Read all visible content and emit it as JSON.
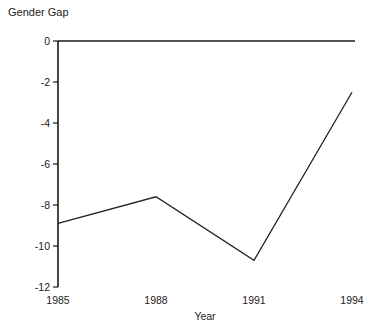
{
  "chart_data": {
    "type": "line",
    "title": "Gender Gap",
    "xlabel": "Year",
    "ylabel": "",
    "x": [
      1985,
      1988,
      1991,
      1994
    ],
    "values": [
      -8.9,
      -7.6,
      -10.7,
      -2.5
    ],
    "series": [
      {
        "name": "Gender Gap",
        "values": [
          -8.9,
          -7.6,
          -10.7,
          -2.5
        ]
      }
    ],
    "xtick_labels": [
      "1985",
      "1988",
      "1991",
      "1994"
    ],
    "xticks": [
      1985,
      1988,
      1991,
      1994
    ],
    "ytick_labels": [
      "0",
      "-2",
      "-4",
      "-6",
      "-8",
      "-10",
      "-12"
    ],
    "yticks": [
      0,
      -2,
      -4,
      -6,
      -8,
      -10,
      -12
    ],
    "xlim": [
      1985,
      1994
    ],
    "ylim": [
      -12,
      0
    ],
    "grid": false,
    "legend": "none",
    "line_color": "#222222",
    "background_color": "#ffffff",
    "axis_color": "#1a1a1a"
  }
}
